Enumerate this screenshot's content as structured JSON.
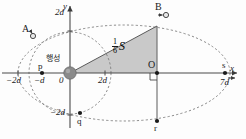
{
  "figure": {
    "type": "orbital-diagram",
    "planet_label": "행성",
    "area_label": {
      "numerator": "1",
      "denominator": "6",
      "symbol": "S"
    }
  },
  "axes": {
    "x_axis_label": "x",
    "y_axis_label": "y",
    "origin_label": "0",
    "x_ticks": [
      {
        "label": "−2d",
        "value": -2
      },
      {
        "label": "−d",
        "value": -1
      },
      {
        "label": "2d",
        "value": 2
      },
      {
        "label": "7d",
        "value": 7
      }
    ],
    "y_ticks": [
      {
        "label": "2d",
        "value": 2
      },
      {
        "label": "−2d",
        "value": -2
      }
    ]
  },
  "points": [
    {
      "name": "A",
      "label": "A",
      "kind": "moving-body"
    },
    {
      "name": "B",
      "label": "B",
      "kind": "moving-body"
    },
    {
      "name": "p",
      "label": "p",
      "kind": "orbit-point"
    },
    {
      "name": "q",
      "label": "q",
      "kind": "orbit-point"
    },
    {
      "name": "r",
      "label": "r",
      "kind": "orbit-point"
    },
    {
      "name": "s",
      "label": "s",
      "kind": "orbit-point"
    },
    {
      "name": "O",
      "label": "O",
      "kind": "center-point"
    }
  ],
  "colors": {
    "shade": "#c9c9c9",
    "line": "#3a3a3a",
    "planet": "#8a8a8a",
    "text": "#1a1a1a"
  }
}
